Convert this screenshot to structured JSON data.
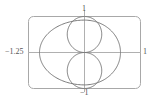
{
  "chart_data": {
    "type": "line",
    "subtype": "polar-curves",
    "title": "",
    "xlabel": "",
    "ylabel": "",
    "xlim": [
      -1.25,
      1
    ],
    "ylim": [
      -1,
      1
    ],
    "grid": false,
    "frame": "rounded-rectangle",
    "tick_labels": {
      "x_left": "−1.25",
      "x_right": "1",
      "y_top": "1",
      "y_bottom": "−1"
    },
    "series": [
      {
        "name": "outer-curve",
        "description": "oval-shaped closed curve spanning x from -1.25 to 1, y from about -0.9 to 0.9",
        "x_extent": [
          -1.25,
          1
        ],
        "y_extent": [
          -0.9,
          0.9
        ]
      },
      {
        "name": "inner-curve",
        "description": "vertical figure-eight with two loops meeting at the origin, y from -1 to 1, x from about -0.4 to 0.4",
        "x_extent": [
          -0.4,
          0.4
        ],
        "y_extent": [
          -1,
          1
        ]
      }
    ],
    "colors": {
      "curve": "#7a7a7a",
      "axis": "#9a9a9a",
      "frame": "#a0a0a0"
    }
  }
}
